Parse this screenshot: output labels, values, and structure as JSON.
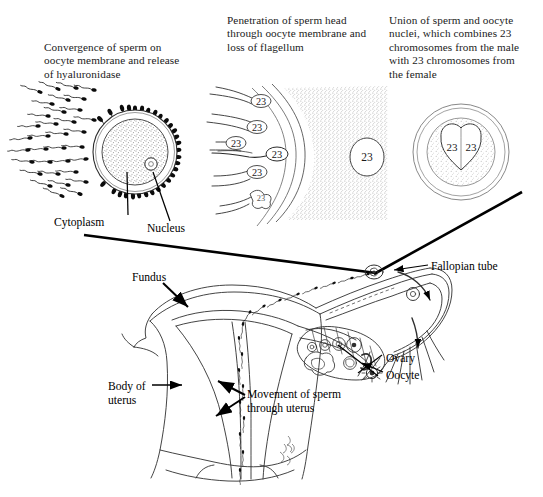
{
  "figure": {
    "background_color": "#ffffff",
    "ink_color": "#000000",
    "stipple_color": "#8a8a8a",
    "width": 543,
    "height": 497
  },
  "panels": {
    "left": {
      "caption": "Convergence of sperm on\noocyte membrane and release\nof hyaluronidase",
      "labels": {
        "cytoplasm": "Cytoplasm",
        "nucleus": "Nucleus"
      },
      "sperm_count_swarm": 34,
      "sperm_count_attached": 30
    },
    "middle": {
      "caption": "Penetration of sperm head\nthrough oocyte membrane and\nloss of flagellum",
      "sperm_chromosome_labels": [
        "23",
        "23",
        "23",
        "23",
        "23"
      ],
      "penetrating_sperm_label": "23",
      "oocyte_nucleus_label": "23"
    },
    "right": {
      "caption": "Union of sperm and oocyte\nnuclei, which combines 23\nchromosomes from the male\nwith 23 chromosomes from\nthe female",
      "fused_nucleus_labels": [
        "23",
        "23"
      ]
    }
  },
  "anatomy": {
    "labels": {
      "fundus": "Fundus",
      "fallopian_tube": "Fallopian tube",
      "ovary": "Ovary",
      "oocyte": "Oocyte",
      "body_of_uterus": "Body of\nuterus",
      "movement_of_sperm": "Movement of sperm\nthrough uterus"
    },
    "follicle_count": 9,
    "sperm_in_uterus_count": 18
  }
}
